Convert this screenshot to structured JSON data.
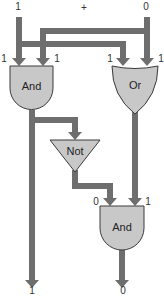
{
  "diagram": {
    "title_symbol": "+",
    "inputs": {
      "a": "1",
      "b": "0"
    },
    "gates": {
      "and_top": {
        "label": "And",
        "inputs": [
          "1",
          "1"
        ]
      },
      "or_top": {
        "label": "Or",
        "inputs": [
          "1",
          "1"
        ]
      },
      "not": {
        "label": "Not"
      },
      "and_bottom": {
        "label": "And",
        "inputs": [
          "0",
          "1"
        ]
      }
    },
    "outputs": {
      "carry": "1",
      "sum": "0"
    },
    "colors": {
      "wire": "#6e6e6e",
      "gate_fill": "#c8c8c8",
      "gate_stroke": "#3a3a3a",
      "text": "#333333"
    }
  }
}
